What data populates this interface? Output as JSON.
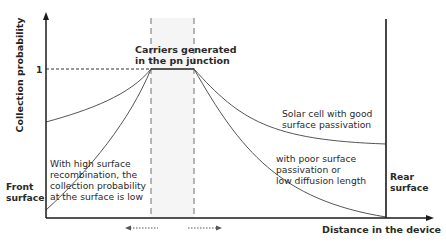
{
  "diagram": {
    "y_axis_label": "Collection probability",
    "x_axis_label": "Distance in the device",
    "y_tick_one": "1",
    "front_surface_label": [
      "Front",
      "surface"
    ],
    "rear_surface_label": [
      "Rear",
      "surface"
    ],
    "junction_label": [
      "Carriers generated",
      "in the pn junction"
    ],
    "good_passivation_label": [
      "Solar cell with good",
      "surface passivation"
    ],
    "poor_passivation_label": [
      "with poor surface",
      "passivation or",
      "low diffusion length"
    ],
    "high_recombination_label": [
      "With high surface",
      "recombination, the",
      "collection probability",
      "at the surface is low"
    ],
    "colors": {
      "axis": "#1a1a1a",
      "curve": "#555555",
      "dashed": "#777777",
      "junction_fill": "#f4f4f4"
    }
  }
}
